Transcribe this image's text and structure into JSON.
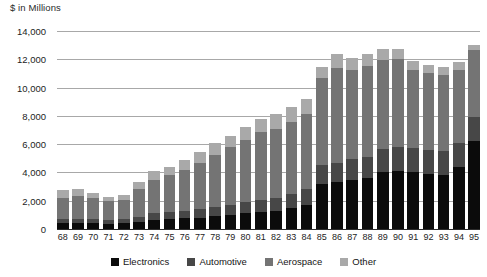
{
  "chart_data": {
    "type": "bar",
    "subtype": "stacked-bar",
    "title": "",
    "axis_title": "$ in Millions",
    "xlabel": "",
    "ylabel": "$ in Millions",
    "ylim": [
      0,
      14000
    ],
    "yticks": [
      0,
      2000,
      4000,
      6000,
      8000,
      10000,
      12000,
      14000
    ],
    "ytick_labels": [
      "0",
      "2,000",
      "4,000",
      "6,000",
      "8,000",
      "10,000",
      "12,000",
      "14,000"
    ],
    "grid": true,
    "grid_axis": "y",
    "legend_position": "bottom-center",
    "categories": [
      "68",
      "69",
      "70",
      "71",
      "72",
      "73",
      "74",
      "75",
      "76",
      "77",
      "78",
      "79",
      "80",
      "81",
      "82",
      "83",
      "84",
      "85",
      "86",
      "87",
      "88",
      "89",
      "90",
      "91",
      "92",
      "93",
      "94",
      "95"
    ],
    "series": [
      {
        "name": "Electronics",
        "color": "#0b0b0b",
        "values": [
          400,
          400,
          400,
          380,
          400,
          500,
          650,
          700,
          750,
          800,
          900,
          1000,
          1100,
          1200,
          1300,
          1500,
          1700,
          3200,
          3300,
          3500,
          3600,
          4050,
          4100,
          4000,
          3900,
          3850,
          4350,
          6200
        ]
      },
      {
        "name": "Automotive",
        "color": "#474747",
        "values": [
          300,
          300,
          280,
          270,
          280,
          350,
          450,
          500,
          550,
          600,
          650,
          700,
          800,
          850,
          900,
          1000,
          1100,
          1350,
          1400,
          1450,
          1500,
          1600,
          1700,
          1750,
          1700,
          1650,
          1700,
          1750
        ]
      },
      {
        "name": "Aerospace",
        "color": "#747474",
        "values": [
          1500,
          1600,
          1500,
          1350,
          1400,
          1950,
          2400,
          2600,
          2900,
          3300,
          3700,
          4100,
          4400,
          4800,
          4900,
          5100,
          5300,
          6100,
          6700,
          6300,
          6400,
          6300,
          6200,
          5500,
          5400,
          5400,
          5200,
          4700
        ]
      },
      {
        "name": "Other",
        "color": "#a9a9a9",
        "values": [
          550,
          500,
          350,
          300,
          350,
          500,
          600,
          600,
          700,
          750,
          800,
          800,
          900,
          900,
          1000,
          1000,
          1100,
          800,
          1000,
          850,
          900,
          800,
          700,
          600,
          600,
          550,
          550,
          350
        ]
      }
    ],
    "totals": [
      2750,
      2800,
      2530,
      2300,
      2430,
      3300,
      4100,
      4400,
      4900,
      5450,
      6050,
      6600,
      7200,
      7750,
      8100,
      8600,
      9200,
      11450,
      12400,
      12100,
      12400,
      12750,
      12700,
      11850,
      11600,
      11450,
      11800,
      13000
    ]
  },
  "legend": {
    "items": [
      {
        "label": "Electronics",
        "color": "#0b0b0b"
      },
      {
        "label": "Automotive",
        "color": "#474747"
      },
      {
        "label": "Aerospace",
        "color": "#747474"
      },
      {
        "label": "Other",
        "color": "#a9a9a9"
      }
    ]
  }
}
